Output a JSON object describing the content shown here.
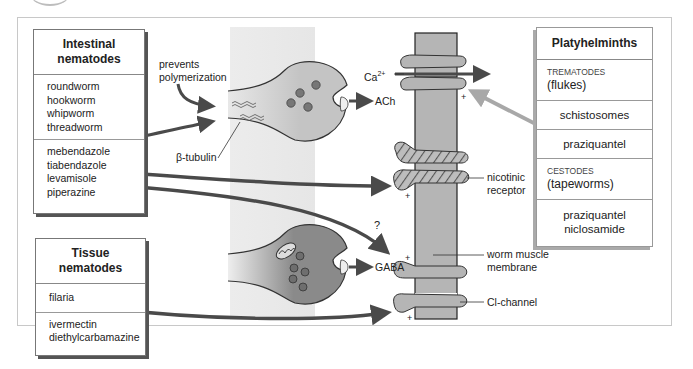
{
  "intestinal_box": {
    "title_line1": "Intestinal",
    "title_line2": "nematodes",
    "worms": [
      "roundworm",
      "hookworm",
      "whipworm",
      "threadworm"
    ],
    "drugs": [
      "mebendazole",
      "tiabendazole",
      "levamisole",
      "piperazine"
    ]
  },
  "tissue_box": {
    "title": "Tissue nematodes",
    "worms": [
      "filaria"
    ],
    "drugs": [
      "ivermectin",
      "diethylcarbamazine"
    ]
  },
  "platyhelminths_box": {
    "title": "Platyhelminths",
    "trematodes_label": "TREMATODES",
    "trematodes_common": "(flukes)",
    "trematode_example": "schistosomes",
    "trematode_drug": "praziquantel",
    "cestodes_label": "CESTODES",
    "cestodes_common": "(tapeworms)",
    "cestode_drugs": [
      "praziquantel",
      "niclosamide"
    ]
  },
  "labels": {
    "prevents_line1": "prevents",
    "prevents_line2": "polymerization",
    "beta_tubulin": "β-tubulin",
    "ach": "ACh",
    "gaba": "GABA",
    "calcium": "Ca",
    "calcium_charge": "2+",
    "question": "?",
    "nicotinic_line1": "nicotinic",
    "nicotinic_line2": "receptor",
    "muscle_line1": "worm muscle",
    "muscle_line2": "membrane",
    "cl_channel": "Cl-channel",
    "plus": "+"
  },
  "colors": {
    "arrow_dark": "#4a4a4a",
    "arrow_light": "#a8a8a8",
    "neuron_fill": "#c4c4c4",
    "gaba_neuron_fill": "#8f8f8f",
    "membrane_fill": "#b5b5b5",
    "shade_panel": "#e8e8e8"
  }
}
